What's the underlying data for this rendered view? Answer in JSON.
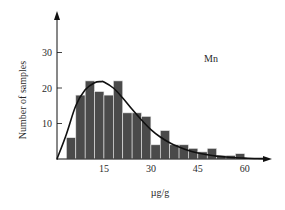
{
  "chart_data": {
    "type": "bar",
    "subtype": "histogram-with-fitted-curve",
    "title": "",
    "annotation": "Mn",
    "xlabel": "µg/g",
    "ylabel": "Number of samples",
    "xlim": [
      0,
      66
    ],
    "ylim": [
      0,
      38
    ],
    "x_ticks": [
      15,
      30,
      45,
      60
    ],
    "y_ticks": [
      10,
      20,
      30
    ],
    "bin_width": 3,
    "bin_starts": [
      3,
      6,
      9,
      12,
      15,
      18,
      21,
      24,
      27,
      30,
      33,
      36,
      39,
      42,
      45,
      48,
      51,
      54,
      57
    ],
    "values": [
      6,
      18,
      22,
      19,
      18,
      22,
      13,
      13,
      12,
      4,
      8,
      4,
      4,
      3,
      2,
      3,
      1,
      1,
      1.5
    ],
    "bar_color": "#4a4a4a",
    "curve": {
      "name": "fitted distribution",
      "x": [
        0,
        3,
        6,
        9,
        12,
        14,
        15,
        18,
        21,
        24,
        27,
        30,
        33,
        36,
        39,
        42,
        45,
        48,
        51,
        54,
        57,
        60,
        63,
        66
      ],
      "y": [
        0,
        7,
        15,
        19.5,
        21.5,
        21.8,
        21.7,
        20,
        17.2,
        14,
        11,
        8.3,
        6.2,
        4.6,
        3.4,
        2.4,
        1.7,
        1.2,
        0.8,
        0.55,
        0.35,
        0.25,
        0.15,
        0.1
      ]
    },
    "grid": false,
    "legend": null
  }
}
